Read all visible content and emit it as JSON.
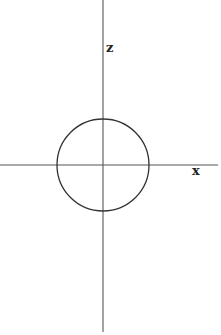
{
  "diagram": {
    "type": "coordinate-axes-with-circle",
    "axes": {
      "horizontal": {
        "label": "x"
      },
      "vertical": {
        "label": "z"
      }
    },
    "circle": {
      "center": "origin",
      "description": "circle centered at the origin"
    },
    "colors": {
      "stroke": "#333333",
      "background": "#ffffff"
    }
  }
}
